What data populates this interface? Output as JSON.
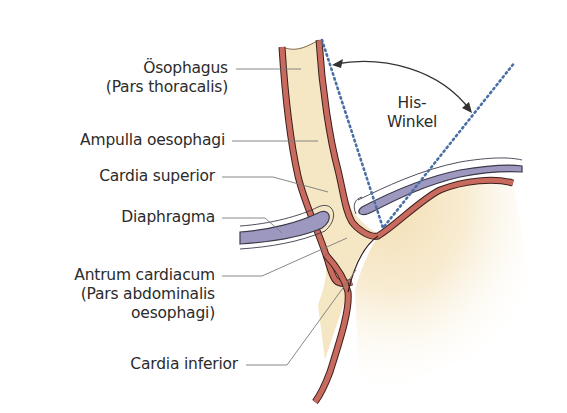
{
  "diagram": {
    "colors": {
      "lumen_fill": "#f5e6c4",
      "wall": "#c96a5e",
      "wall_outline": "#3a1f1c",
      "diaphragm_fill": "#9d98c0",
      "diaphragm_outline": "#3d3a4a",
      "dotted_line": "#4a6fa5",
      "leader_line": "#7a7a7a",
      "arrow": "#333333",
      "text": "#2b2b2b"
    },
    "labels": {
      "oesophagus_line1": "Ösophagus",
      "oesophagus_line2": "(Pars thoracalis)",
      "ampulla": "Ampulla oesophagi",
      "cardia_superior": "Cardia superior",
      "diaphragma": "Diaphragma",
      "antrum_line1": "Antrum cardiacum",
      "antrum_line2": "(Pars abdominalis",
      "antrum_line3": "oesophagi)",
      "cardia_inferior": "Cardia inferior",
      "his_line1": "His-",
      "his_line2": "Winkel"
    }
  }
}
